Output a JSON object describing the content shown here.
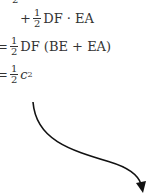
{
  "equation": {
    "cut_denominator": "2",
    "line1": {
      "op": "+",
      "num": "1",
      "den": "2",
      "expr": "DF · EA"
    },
    "line2": {
      "op": "=",
      "num": "1",
      "den": "2",
      "expr": "DF (BE + EA)"
    },
    "line3": {
      "op": "=",
      "num": "1",
      "den": "2",
      "base": "c",
      "exp": "2"
    }
  },
  "arrow": {
    "color": "#111111",
    "direction": "curved-down-right"
  }
}
